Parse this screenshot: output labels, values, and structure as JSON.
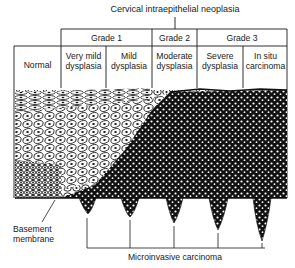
{
  "diagram": {
    "title": "Cervical intraepithelial neoplasia",
    "grades": [
      {
        "label": "Grade 1"
      },
      {
        "label": "Grade 2"
      },
      {
        "label": "Grade 3"
      }
    ],
    "stages": [
      {
        "line1": "Normal",
        "line2": ""
      },
      {
        "line1": "Very mild",
        "line2": "dysplasia"
      },
      {
        "line1": "Mild",
        "line2": "dysplasia"
      },
      {
        "line1": "Moderate",
        "line2": "dysplasia"
      },
      {
        "line1": "Severe",
        "line2": "dysplasia"
      },
      {
        "line1": "In situ",
        "line2": "carcinoma"
      }
    ],
    "labels": {
      "basement_membrane_line1": "Basement",
      "basement_membrane_line2": "membrane",
      "microinvasive": "Microinvasive carcinoma"
    },
    "colors": {
      "ink": "#1a1a1a",
      "background": "#ffffff"
    }
  }
}
